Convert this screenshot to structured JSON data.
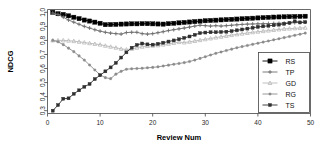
{
  "chart_data": {
    "type": "line",
    "title": "",
    "xlabel": "Review Num",
    "ylabel": "NDCG",
    "xlim": [
      0,
      50
    ],
    "ylim": [
      0.28,
      1.02
    ],
    "xticks": [
      0,
      10,
      20,
      30,
      40,
      50
    ],
    "xticklabels": [
      "0",
      "10",
      "20",
      "30",
      "40",
      "50"
    ],
    "yticks": [
      0.3,
      0.4,
      0.5,
      0.6,
      0.7,
      0.8,
      0.9,
      1.0
    ],
    "yticklabels": [
      "0.3",
      "0.4",
      "0.5",
      "0.6",
      "0.7",
      "0.8",
      "0.9",
      "1.0"
    ],
    "grid": false,
    "legend_position": "bottom-right",
    "x": [
      1,
      2,
      3,
      4,
      5,
      6,
      7,
      8,
      9,
      10,
      11,
      12,
      13,
      14,
      15,
      16,
      17,
      18,
      19,
      20,
      21,
      22,
      23,
      24,
      25,
      26,
      27,
      28,
      29,
      30,
      31,
      32,
      33,
      34,
      35,
      36,
      37,
      38,
      39,
      40,
      41,
      42,
      43,
      44,
      45,
      46,
      47,
      48,
      49
    ],
    "series": [
      {
        "name": "RS",
        "color": "#000000",
        "marker": "square-filled",
        "values": [
          1.0,
          0.99,
          0.985,
          0.975,
          0.965,
          0.955,
          0.945,
          0.938,
          0.93,
          0.922,
          0.912,
          0.913,
          0.914,
          0.916,
          0.917,
          0.918,
          0.918,
          0.919,
          0.919,
          0.918,
          0.917,
          0.916,
          0.919,
          0.922,
          0.925,
          0.928,
          0.931,
          0.934,
          0.937,
          0.94,
          0.942,
          0.944,
          0.946,
          0.948,
          0.95,
          0.952,
          0.954,
          0.956,
          0.958,
          0.96,
          0.962,
          0.964,
          0.966,
          0.967,
          0.968,
          0.969,
          0.97,
          0.971,
          0.972
        ]
      },
      {
        "name": "TP",
        "color": "#6e6e6e",
        "marker": "plus",
        "values": [
          0.995,
          0.985,
          0.965,
          0.945,
          0.93,
          0.915,
          0.9,
          0.888,
          0.876,
          0.866,
          0.858,
          0.852,
          0.848,
          0.845,
          0.856,
          0.858,
          0.858,
          0.848,
          0.845,
          0.848,
          0.855,
          0.862,
          0.87,
          0.876,
          0.882,
          0.888,
          0.895,
          0.902,
          0.908,
          0.905,
          0.902,
          0.905,
          0.902,
          0.905,
          0.908,
          0.911,
          0.914,
          0.916,
          0.917,
          0.918,
          0.919,
          0.92,
          0.921,
          0.922,
          0.923,
          0.924,
          0.926,
          0.928,
          0.93
        ]
      },
      {
        "name": "GD",
        "color": "#b9b9b9",
        "marker": "triangle",
        "values": [
          0.8,
          0.8,
          0.8,
          0.798,
          0.795,
          0.79,
          0.785,
          0.78,
          0.775,
          0.77,
          0.762,
          0.755,
          0.748,
          0.74,
          0.735,
          0.74,
          0.748,
          0.755,
          0.76,
          0.762,
          0.765,
          0.77,
          0.776,
          0.782,
          0.788,
          0.785,
          0.79,
          0.796,
          0.802,
          0.808,
          0.814,
          0.82,
          0.826,
          0.832,
          0.838,
          0.843,
          0.848,
          0.853,
          0.858,
          0.862,
          0.866,
          0.87,
          0.874,
          0.878,
          0.882,
          0.884,
          0.886,
          0.888,
          0.89
        ]
      },
      {
        "name": "RG",
        "color": "#8c8c8c",
        "marker": "dot",
        "values": [
          0.8,
          0.79,
          0.77,
          0.745,
          0.72,
          0.69,
          0.66,
          0.625,
          0.59,
          0.555,
          0.535,
          0.528,
          0.56,
          0.58,
          0.595,
          0.598,
          0.6,
          0.602,
          0.605,
          0.608,
          0.612,
          0.618,
          0.624,
          0.63,
          0.636,
          0.642,
          0.65,
          0.66,
          0.672,
          0.684,
          0.696,
          0.708,
          0.718,
          0.728,
          0.738,
          0.748,
          0.756,
          0.764,
          0.772,
          0.78,
          0.788,
          0.796,
          0.804,
          0.812,
          0.82,
          0.828,
          0.836,
          0.844,
          0.852
        ]
      },
      {
        "name": "TS",
        "color": "#2f2f2f",
        "marker": "square-small",
        "values": [
          0.3,
          0.34,
          0.385,
          0.388,
          0.42,
          0.445,
          0.47,
          0.49,
          0.525,
          0.552,
          0.58,
          0.608,
          0.64,
          0.678,
          0.715,
          0.748,
          0.768,
          0.778,
          0.772,
          0.77,
          0.776,
          0.784,
          0.792,
          0.8,
          0.808,
          0.818,
          0.828,
          0.84,
          0.852,
          0.856,
          0.858,
          0.858,
          0.86,
          0.862,
          0.866,
          0.872,
          0.878,
          0.884,
          0.89,
          0.896,
          0.9,
          0.904,
          0.908,
          0.912,
          0.918,
          0.925,
          0.936,
          0.928,
          0.93
        ]
      }
    ]
  },
  "legend": {
    "entries": [
      {
        "label": "RS"
      },
      {
        "label": "TP"
      },
      {
        "label": "GD"
      },
      {
        "label": "RG"
      },
      {
        "label": "TS"
      }
    ]
  }
}
